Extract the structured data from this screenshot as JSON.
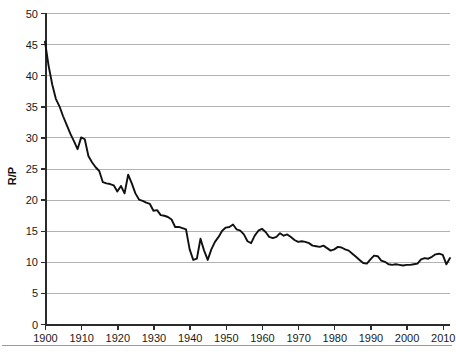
{
  "chart_data": {
    "type": "line",
    "title": "",
    "xlabel": "",
    "ylabel": "R/P",
    "xlim": [
      1900,
      2012
    ],
    "ylim": [
      0,
      50
    ],
    "ytick_step": 5,
    "xtick_step": 10,
    "grid": true,
    "legend": null,
    "yticks": [
      "0",
      "5",
      "10",
      "15",
      "20",
      "25",
      "30",
      "35",
      "40",
      "45",
      "50"
    ],
    "xticks": [
      "1900",
      "1910",
      "1920",
      "1930",
      "1940",
      "1950",
      "1960",
      "1970",
      "1980",
      "1990",
      "2000",
      "2010"
    ],
    "line_color": "#111111",
    "grid_color": "#b3b3b3",
    "axis_color": "#2b2b2b",
    "series": [
      {
        "name": "R/P",
        "x": [
          1900,
          1901,
          1902,
          1903,
          1904,
          1905,
          1906,
          1907,
          1908,
          1909,
          1910,
          1911,
          1912,
          1913,
          1914,
          1915,
          1916,
          1917,
          1918,
          1919,
          1920,
          1921,
          1922,
          1923,
          1924,
          1925,
          1926,
          1927,
          1928,
          1929,
          1930,
          1931,
          1932,
          1933,
          1934,
          1935,
          1936,
          1937,
          1938,
          1939,
          1940,
          1941,
          1942,
          1943,
          1944,
          1945,
          1946,
          1947,
          1948,
          1949,
          1950,
          1951,
          1952,
          1953,
          1954,
          1955,
          1956,
          1957,
          1958,
          1959,
          1960,
          1961,
          1962,
          1963,
          1964,
          1965,
          1966,
          1967,
          1968,
          1969,
          1970,
          1971,
          1972,
          1973,
          1974,
          1975,
          1976,
          1977,
          1978,
          1979,
          1980,
          1981,
          1982,
          1983,
          1984,
          1985,
          1986,
          1987,
          1988,
          1989,
          1990,
          1991,
          1992,
          1993,
          1994,
          1995,
          1996,
          1997,
          1998,
          1999,
          2000,
          2001,
          2002,
          2003,
          2004,
          2005,
          2006,
          2007,
          2008,
          2009,
          2010,
          2011,
          2012
        ],
        "values": [
          45.4,
          41.5,
          38.5,
          36.2,
          35.0,
          33.4,
          32.0,
          30.6,
          29.4,
          28.1,
          30.0,
          29.7,
          27.0,
          26.0,
          25.2,
          24.6,
          22.8,
          22.6,
          22.5,
          22.3,
          21.3,
          22.2,
          21.0,
          24.0,
          22.6,
          21.0,
          20.0,
          19.8,
          19.5,
          19.3,
          18.2,
          18.3,
          17.5,
          17.4,
          17.2,
          16.8,
          15.6,
          15.6,
          15.4,
          15.2,
          12.0,
          10.3,
          10.5,
          13.7,
          11.8,
          10.3,
          12.0,
          13.2,
          14.0,
          15.0,
          15.5,
          15.6,
          16.0,
          15.2,
          15.0,
          14.4,
          13.3,
          13.0,
          14.2,
          15.0,
          15.3,
          14.8,
          14.0,
          13.8,
          14.0,
          14.6,
          14.2,
          14.4,
          14.0,
          13.5,
          13.2,
          13.3,
          13.2,
          13.0,
          12.6,
          12.5,
          12.4,
          12.6,
          12.2,
          11.8,
          12.0,
          12.4,
          12.3,
          12.0,
          11.8,
          11.3,
          10.8,
          10.3,
          9.8,
          9.7,
          10.4,
          11.0,
          10.9,
          10.2,
          10.0,
          9.6,
          9.5,
          9.6,
          9.5,
          9.4,
          9.5,
          9.5,
          9.6,
          9.7,
          10.4,
          10.6,
          10.5,
          10.8,
          11.2,
          11.3,
          11.1,
          9.6,
          10.6
        ]
      }
    ]
  },
  "caption": {
    "text": ""
  }
}
